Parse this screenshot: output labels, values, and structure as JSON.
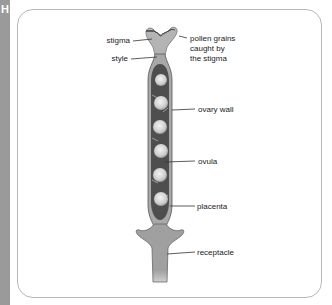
{
  "section_letter": "H",
  "labels": {
    "stigma": "stigma",
    "style": "style",
    "pollen_line1": "pollen grains",
    "pollen_line2": "caught by",
    "pollen_line3": "the stigma",
    "ovary_wall": "ovary wall",
    "ovula": "ovula",
    "placenta": "placenta",
    "receptacle": "receptacle"
  },
  "colors": {
    "sidebar": "#9a9a9a",
    "outer_tissue": "#a8a8a8",
    "ovary_cavity": "#555555",
    "ovule": "#d8d8d8",
    "frame_border": "#b8b8b8"
  }
}
